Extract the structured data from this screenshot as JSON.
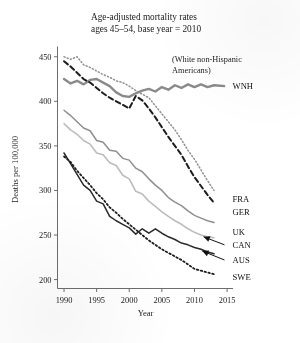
{
  "chart_data": {
    "type": "line",
    "title": "Age-adjusted mortality rates",
    "subtitle": "ages 45–54, base year = 2010",
    "xlabel": "Year",
    "ylabel": "Deaths per 100,000",
    "xlim": [
      1989,
      2015.6
    ],
    "ylim": [
      190,
      457
    ],
    "xticks": [
      1990,
      1995,
      2000,
      2005,
      2010,
      2015
    ],
    "xtick_labels": [
      "1990",
      "1995",
      "2000",
      "2005",
      "2010",
      "2015"
    ],
    "yticks": [
      200,
      250,
      300,
      350,
      400,
      450
    ],
    "ytick_labels": [
      "200",
      "250",
      "300",
      "350",
      "400",
      "450"
    ],
    "grid": false,
    "legend_position": "right-inline-labels",
    "annotation": "(White non-Hispanic Americans)",
    "annotation_lines": [
      "(White non-Hispanic",
      "Americans)"
    ],
    "series": [
      {
        "name": "WNH",
        "label": "WNH",
        "style": "solid-thick",
        "color": "#8a8a8a",
        "width": 2.4,
        "label_x": 2015.3,
        "label_y": 417,
        "leader": false,
        "x": [
          1990,
          1991,
          1992,
          1993,
          1994,
          1995,
          1996,
          1997,
          1998,
          1999,
          2000,
          2001,
          2002,
          2003,
          2004,
          2005,
          2006,
          2007,
          2008,
          2009,
          2010,
          2011,
          2012,
          2013
        ],
        "values": [
          425,
          420,
          423,
          419,
          424,
          425,
          421,
          417,
          410,
          406,
          405,
          409,
          412,
          414,
          411,
          416,
          413,
          418,
          415,
          419,
          416,
          419,
          416,
          418
        ]
      },
      {
        "name": "FRA",
        "label": "FRA",
        "style": "dotted",
        "color": "#8f8f8f",
        "width": 1.5,
        "label_x": 2015.3,
        "label_y": 291,
        "leader": false,
        "x": [
          1990,
          1991,
          1992,
          1993,
          1994,
          1995,
          1996,
          1997,
          1998,
          1999,
          2000,
          2001,
          2002,
          2003,
          2004,
          2005,
          2006,
          2007,
          2008,
          2009,
          2010,
          2011,
          2012,
          2013
        ],
        "values": [
          450,
          447,
          450,
          441,
          438,
          434,
          430,
          427,
          423,
          421,
          417,
          412,
          408,
          404,
          395,
          386,
          377,
          368,
          357,
          345,
          335,
          323,
          311,
          300
        ]
      },
      {
        "name": "GER",
        "label": "GER",
        "style": "dashed",
        "color": "#1d1d1d",
        "width": 2.0,
        "label_x": 2015.3,
        "label_y": 276,
        "leader": false,
        "x": [
          1990,
          1991,
          1992,
          1993,
          1994,
          1995,
          1996,
          1997,
          1998,
          1999,
          2000,
          2001,
          2002,
          2003,
          2004,
          2005,
          2006,
          2007,
          2008,
          2009,
          2010,
          2011,
          2012,
          2013
        ],
        "values": [
          445,
          439,
          432,
          425,
          421,
          415,
          409,
          404,
          400,
          396,
          392,
          406,
          401,
          392,
          382,
          371,
          360,
          350,
          340,
          327,
          315,
          305,
          295,
          286
        ]
      },
      {
        "name": "UK",
        "label": "UK",
        "style": "solid",
        "color": "#8f8f8f",
        "width": 1.5,
        "label_x": 2015.3,
        "label_y": 254,
        "leader": false,
        "x": [
          1990,
          1991,
          1992,
          1993,
          1994,
          1995,
          1996,
          1997,
          1998,
          1999,
          2000,
          2001,
          2002,
          2003,
          2004,
          2005,
          2006,
          2007,
          2008,
          2009,
          2010,
          2011,
          2012,
          2013
        ],
        "values": [
          390,
          384,
          377,
          370,
          367,
          356,
          354,
          345,
          344,
          336,
          334,
          325,
          321,
          313,
          306,
          300,
          292,
          287,
          283,
          277,
          272,
          269,
          266,
          264
        ]
      },
      {
        "name": "CAN",
        "label": "CAN",
        "style": "solid",
        "color": "#bcbcbc",
        "width": 1.6,
        "label_x": 2015.3,
        "label_y": 239,
        "leader": true,
        "leader_from": [
          2014.6,
          239
        ],
        "leader_to": [
          2011.4,
          248
        ],
        "x": [
          1990,
          1991,
          1992,
          1993,
          1994,
          1995,
          1996,
          1997,
          1998,
          1999,
          2000,
          2001,
          2002,
          2003,
          2004,
          2005,
          2006,
          2007,
          2008,
          2009,
          2010,
          2011,
          2012,
          2013
        ],
        "values": [
          375,
          368,
          363,
          356,
          352,
          342,
          340,
          331,
          328,
          317,
          313,
          299,
          296,
          288,
          282,
          276,
          271,
          266,
          262,
          257,
          253,
          250,
          248,
          247
        ]
      },
      {
        "name": "AUS",
        "label": "AUS",
        "style": "solid-dark",
        "color": "#2a2a2a",
        "width": 1.5,
        "label_x": 2015.3,
        "label_y": 222,
        "leader": true,
        "leader_from": [
          2014.6,
          222
        ],
        "leader_to": [
          2011.2,
          232
        ],
        "x": [
          1990,
          1991,
          1992,
          1993,
          1994,
          1995,
          1996,
          1997,
          1998,
          1999,
          2000,
          2001,
          2002,
          2003,
          2004,
          2005,
          2006,
          2007,
          2008,
          2009,
          2010,
          2011,
          2012,
          2013
        ],
        "values": [
          342,
          330,
          318,
          306,
          300,
          288,
          285,
          271,
          266,
          262,
          258,
          251,
          257,
          252,
          257,
          252,
          248,
          245,
          241,
          239,
          236,
          234,
          231,
          229
        ]
      },
      {
        "name": "SWE",
        "label": "SWE",
        "style": "dotted-dark",
        "color": "#1d1d1d",
        "width": 1.8,
        "label_x": 2015.3,
        "label_y": 203,
        "leader": false,
        "x": [
          1990,
          1991,
          1992,
          1993,
          1994,
          1995,
          1996,
          1997,
          1998,
          1999,
          2000,
          2001,
          2002,
          2003,
          2004,
          2005,
          2006,
          2007,
          2008,
          2009,
          2010,
          2011,
          2012,
          2013
        ],
        "values": [
          338,
          332,
          322,
          314,
          306,
          297,
          290,
          281,
          275,
          268,
          262,
          256,
          250,
          244,
          239,
          234,
          230,
          226,
          222,
          217,
          212,
          210,
          208,
          206
        ]
      }
    ]
  }
}
